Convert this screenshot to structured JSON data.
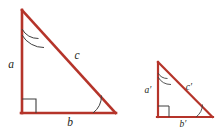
{
  "figure": {
    "background_color": "#ffffff",
    "stroke_color": "#b5342a",
    "mark_color": "#3f3f3f",
    "label_color": "#231f20",
    "stroke_width_large": 2.6,
    "stroke_width_small": 2.2
  },
  "triangles": [
    {
      "name": "large-triangle",
      "vertices": {
        "apex": [
          22,
          10
        ],
        "right_angle": [
          22,
          113
        ],
        "acute": [
          115,
          113
        ]
      },
      "labels": {
        "leg_vertical": "a",
        "leg_horizontal": "b",
        "hypotenuse": "c"
      },
      "label_positions": {
        "leg_vertical": [
          11,
          68
        ],
        "leg_horizontal": [
          70,
          125
        ],
        "hypotenuse": [
          77,
          59
        ]
      },
      "angle_marks": {
        "apex": "double-arc",
        "right_angle": "square",
        "acute": "single-arc"
      }
    },
    {
      "name": "small-triangle",
      "vertices": {
        "apex": [
          158,
          62
        ],
        "right_angle": [
          158,
          117
        ],
        "acute": [
          212,
          117
        ]
      },
      "labels": {
        "leg_vertical": "a′",
        "leg_horizontal": "b′",
        "hypotenuse": "c′"
      },
      "label_positions": {
        "leg_vertical": [
          147,
          91
        ],
        "leg_horizontal": [
          182,
          127
        ],
        "hypotenuse": [
          188,
          89
        ]
      },
      "angle_marks": {
        "apex": "double-arc",
        "right_angle": "square",
        "acute": "single-arc"
      }
    }
  ]
}
